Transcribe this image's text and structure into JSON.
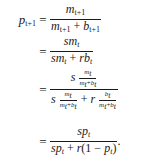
{
  "equation": {
    "lhs": "p",
    "lhs_sub": "t+1",
    "eq_sign": "=",
    "lines": [
      {
        "numerator": "m_{t+1}",
        "denominator": "m_{t+1} + b_{t+1}"
      },
      {
        "numerator": "sm_t",
        "denominator": "sm_t + rb_t"
      },
      {
        "numerator": "s · m_t/(m_t+b_t)",
        "denominator": "s · m_t/(m_t+b_t) + r · b_t/(m_t+b_t)"
      },
      {
        "numerator": "sp_t",
        "denominator": "sp_t + r(1 − p_t)",
        "trailing": "."
      }
    ],
    "symbols": {
      "m": "m",
      "b": "b",
      "s": "s",
      "r": "r",
      "p": "p",
      "t": "t",
      "t1": "t+1",
      "plus": "+",
      "minus": "−",
      "one": "1",
      "lparen": "(",
      "rparen": ")",
      "period": "."
    }
  }
}
